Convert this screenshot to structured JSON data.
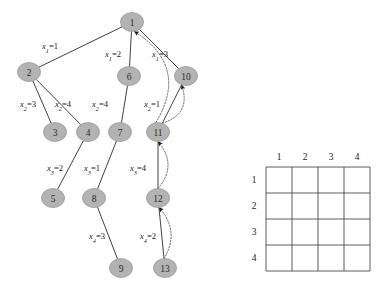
{
  "figure": {
    "graph": {
      "nodes": [
        {
          "id": "1",
          "label": "1",
          "cx": 132,
          "cy": 22
        },
        {
          "id": "2",
          "label": "2",
          "cx": 29,
          "cy": 72
        },
        {
          "id": "3",
          "label": "3",
          "cx": 55,
          "cy": 132
        },
        {
          "id": "4",
          "label": "4",
          "cx": 88,
          "cy": 132
        },
        {
          "id": "5",
          "label": "5",
          "cx": 53,
          "cy": 198
        },
        {
          "id": "6",
          "label": "6",
          "cx": 129,
          "cy": 76
        },
        {
          "id": "7",
          "label": "7",
          "cx": 120,
          "cy": 132
        },
        {
          "id": "8",
          "label": "8",
          "cx": 94,
          "cy": 198
        },
        {
          "id": "9",
          "label": "9",
          "cx": 121,
          "cy": 268
        },
        {
          "id": "10",
          "label": "10",
          "cx": 186,
          "cy": 76
        },
        {
          "id": "11",
          "label": "11",
          "cx": 158,
          "cy": 132
        },
        {
          "id": "12",
          "label": "12",
          "cx": 158,
          "cy": 198
        },
        {
          "id": "13",
          "label": "13",
          "cx": 165,
          "cy": 268
        }
      ],
      "tree_edges": [
        {
          "from": "1",
          "to": "2"
        },
        {
          "from": "1",
          "to": "6"
        },
        {
          "from": "1",
          "to": "10"
        },
        {
          "from": "2",
          "to": "3"
        },
        {
          "from": "2",
          "to": "4"
        },
        {
          "from": "6",
          "to": "7"
        },
        {
          "from": "10",
          "to": "11"
        },
        {
          "from": "4",
          "to": "5"
        },
        {
          "from": "7",
          "to": "8"
        },
        {
          "from": "11",
          "to": "12"
        },
        {
          "from": "8",
          "to": "9"
        },
        {
          "from": "12",
          "to": "13"
        }
      ],
      "back_edges": [
        {
          "from": "11",
          "to": "1"
        },
        {
          "from": "11",
          "to": "10"
        },
        {
          "from": "12",
          "to": "11"
        },
        {
          "from": "13",
          "to": "12"
        }
      ],
      "edge_labels": [
        {
          "var": "x",
          "sub": "1",
          "value": "1",
          "x": 50,
          "y": 46
        },
        {
          "var": "x",
          "sub": "1",
          "value": "2",
          "x": 113,
          "y": 54
        },
        {
          "var": "x",
          "sub": "1",
          "value": "3",
          "x": 160,
          "y": 54
        },
        {
          "var": "x",
          "sub": "2",
          "value": "3",
          "x": 28,
          "y": 104
        },
        {
          "var": "x",
          "sub": "2",
          "value": "4",
          "x": 63,
          "y": 104
        },
        {
          "var": "x",
          "sub": "2",
          "value": "4",
          "x": 100,
          "y": 104
        },
        {
          "var": "x",
          "sub": "2",
          "value": "1",
          "x": 152,
          "y": 104
        },
        {
          "var": "x",
          "sub": "3",
          "value": "2",
          "x": 55,
          "y": 168
        },
        {
          "var": "x",
          "sub": "3",
          "value": "1",
          "x": 92,
          "y": 168
        },
        {
          "var": "x",
          "sub": "3",
          "value": "4",
          "x": 138,
          "y": 168
        },
        {
          "var": "x",
          "sub": "4",
          "value": "3",
          "x": 97,
          "y": 236
        },
        {
          "var": "x",
          "sub": "4",
          "value": "2",
          "x": 148,
          "y": 236
        }
      ],
      "node_radius_x": 11.5,
      "node_radius_y": 9.5,
      "node_fill": "#b3b3b3",
      "edge_color": "#2b2b2b",
      "back_edge_color": "#555555"
    },
    "grid": {
      "column_headers": [
        "1",
        "2",
        "3",
        "4"
      ],
      "row_headers": [
        "1",
        "2",
        "3",
        "4"
      ],
      "cells": [
        [
          "",
          "",
          "",
          ""
        ],
        [
          "",
          "",
          "",
          ""
        ],
        [
          "",
          "",
          "",
          ""
        ],
        [
          "",
          "",
          "",
          ""
        ]
      ],
      "left": 266,
      "top": 167,
      "cell_size": 26,
      "line_color": "#4a4a4a"
    }
  }
}
